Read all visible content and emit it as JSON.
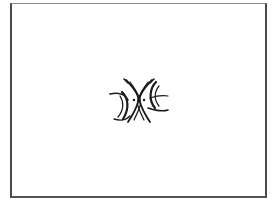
{
  "image": {
    "description": "Black line-art emblem centered inside a thin rectangular frame on white background",
    "background_color": "#ffffff",
    "frame_color": "#4a4a4a",
    "symbol": {
      "name": "mirrored-crescent-emblem",
      "color": "#1a1a1a",
      "parts": [
        "left-outer-crescent",
        "right-outer-crescent",
        "crossed-inner-arcs",
        "center-dots"
      ]
    }
  }
}
